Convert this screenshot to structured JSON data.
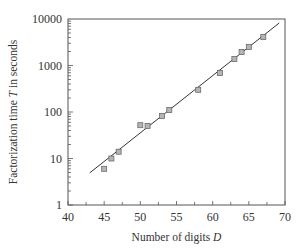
{
  "chart_data": {
    "type": "scatter",
    "title": "",
    "xlabel": "Number of digits D",
    "xlabel_parts": [
      "Number of digits ",
      "D"
    ],
    "ylabel": "Factorization time T in seconds",
    "ylabel_parts": [
      "Factorization time ",
      "T",
      " in seconds"
    ],
    "xlim": [
      40,
      70
    ],
    "ylim": [
      1,
      10000
    ],
    "yscale": "log",
    "x_ticks": [
      40,
      45,
      50,
      55,
      60,
      65,
      70
    ],
    "y_ticks": [
      1,
      10,
      100,
      1000,
      10000
    ],
    "x_tick_labels": [
      "40",
      "45",
      "50",
      "55",
      "60",
      "65",
      "70"
    ],
    "y_tick_labels": [
      "1",
      "10",
      "100",
      "1000",
      "10000"
    ],
    "grid": false,
    "legend": null,
    "series": [
      {
        "name": "Measured",
        "marker": "square",
        "color": "#9a9a9a",
        "x": [
          45,
          46,
          47,
          50,
          51,
          53,
          54,
          58,
          61,
          63,
          64,
          65,
          67
        ],
        "y": [
          6,
          10,
          14,
          52,
          50,
          82,
          110,
          300,
          690,
          1380,
          1950,
          2500,
          4100
        ]
      },
      {
        "name": "Fit",
        "type": "line",
        "color": "#333333",
        "x": [
          43,
          69.2
        ],
        "y": [
          4.9,
          8200
        ]
      }
    ]
  }
}
